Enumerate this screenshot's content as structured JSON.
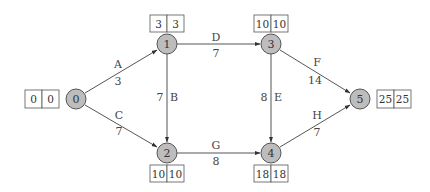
{
  "diagram": {
    "type": "activity-on-arrow network (critical path)",
    "nodes": [
      {
        "id": "0",
        "label": "0",
        "es": "0",
        "ls": "0"
      },
      {
        "id": "1",
        "label": "1",
        "es": "3",
        "ls": "3"
      },
      {
        "id": "2",
        "label": "2",
        "es": "10",
        "ls": "10"
      },
      {
        "id": "3",
        "label": "3",
        "es": "10",
        "ls": "10"
      },
      {
        "id": "4",
        "label": "4",
        "es": "18",
        "ls": "18"
      },
      {
        "id": "5",
        "label": "5",
        "es": "25",
        "ls": "25"
      }
    ],
    "edges": [
      {
        "from": "0",
        "to": "1",
        "activity": "A",
        "duration": "3"
      },
      {
        "from": "0",
        "to": "2",
        "activity": "C",
        "duration": "7"
      },
      {
        "from": "1",
        "to": "2",
        "activity": "B",
        "duration": "7"
      },
      {
        "from": "1",
        "to": "3",
        "activity": "D",
        "duration": "7"
      },
      {
        "from": "2",
        "to": "4",
        "activity": "G",
        "duration": "8"
      },
      {
        "from": "3",
        "to": "4",
        "activity": "E",
        "duration": "8"
      },
      {
        "from": "3",
        "to": "5",
        "activity": "F",
        "duration": "14"
      },
      {
        "from": "4",
        "to": "5",
        "activity": "H",
        "duration": "7"
      }
    ]
  }
}
